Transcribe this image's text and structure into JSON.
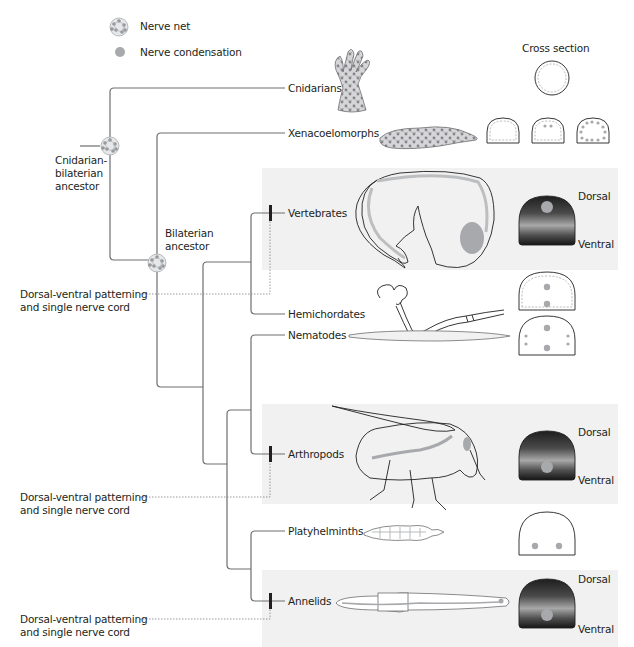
{
  "legend": {
    "nerve_net": {
      "icon": "nerve-net-icon",
      "label": "Nerve net"
    },
    "nerve_condensation": {
      "icon": "nerve-condensation-dot-icon",
      "label": "Nerve condensation",
      "color": "#a7a9ac"
    }
  },
  "cross_section_header": "Cross section",
  "nodes": {
    "cnidarian_bilaterian": "Cnidarian-\nbilaterian\nancestor",
    "bilaterian": "Bilaterian\nancestor"
  },
  "taxa": [
    {
      "name": "Cnidarians",
      "highlighted": false,
      "cross_section": "circle-dashed"
    },
    {
      "name": "Xenacoelomorphs",
      "highlighted": false,
      "cross_section": "three-dashed-domes"
    },
    {
      "name": "Vertebrates",
      "highlighted": true,
      "cross_section": "dark-dome-dorsal-cord",
      "dorsal": "Dorsal",
      "ventral": "Ventral"
    },
    {
      "name": "Hemichordates",
      "highlighted": false,
      "cross_section": "dashed-dome-two-dots"
    },
    {
      "name": "Nematodes",
      "highlighted": false,
      "cross_section": "dome-dorsal-ventral-lateral-dots"
    },
    {
      "name": "Arthropods",
      "highlighted": true,
      "cross_section": "dark-dome-ventral-cord",
      "dorsal": "Dorsal",
      "ventral": "Ventral"
    },
    {
      "name": "Platyhelminths",
      "highlighted": false,
      "cross_section": "dome-two-ventral-dots"
    },
    {
      "name": "Annelids",
      "highlighted": true,
      "cross_section": "dark-dome-ventral-cord",
      "dorsal": "Dorsal",
      "ventral": "Ventral"
    }
  ],
  "annotations": [
    {
      "text": "Dorsal-ventral patterning\nand single nerve cord",
      "target": "Vertebrates"
    },
    {
      "text": "Dorsal-ventral patterning\nand single nerve cord",
      "target": "Arthropods"
    },
    {
      "text": "Dorsal-ventral patterning\nand single nerve cord",
      "target": "Annelids"
    }
  ],
  "colors": {
    "line": "#6d6e71",
    "band": "#f1f1f2",
    "nerve": "#a7a9ac",
    "dark_top": "#2b2b2b",
    "dark_mid": "#9d9d9d",
    "dark_bottom": "#1a1a1a"
  }
}
